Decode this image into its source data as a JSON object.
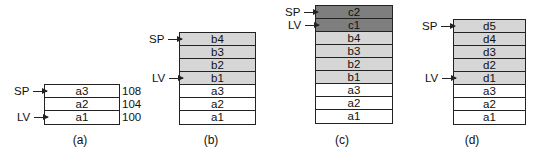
{
  "figure": {
    "panels": [
      {
        "caption": "(a)",
        "cells": [
          {
            "label": "a3",
            "shade": "white",
            "addr": "108"
          },
          {
            "label": "a2",
            "shade": "white",
            "addr": "104"
          },
          {
            "label": "a1",
            "shade": "white",
            "addr": "100"
          }
        ],
        "pointers": {
          "sp": "SP",
          "lv": "LV"
        }
      },
      {
        "caption": "(b)",
        "cells": [
          {
            "label": "b4",
            "shade": "light"
          },
          {
            "label": "b3",
            "shade": "light"
          },
          {
            "label": "b2",
            "shade": "light"
          },
          {
            "label": "b1",
            "shade": "light"
          },
          {
            "label": "a3",
            "shade": "white"
          },
          {
            "label": "a2",
            "shade": "white"
          },
          {
            "label": "a1",
            "shade": "white"
          }
        ],
        "pointers": {
          "sp": "SP",
          "lv": "LV"
        }
      },
      {
        "caption": "(c)",
        "cells": [
          {
            "label": "c2",
            "shade": "dark"
          },
          {
            "label": "c1",
            "shade": "dark"
          },
          {
            "label": "b4",
            "shade": "light"
          },
          {
            "label": "b3",
            "shade": "light"
          },
          {
            "label": "b2",
            "shade": "light"
          },
          {
            "label": "b1",
            "shade": "light"
          },
          {
            "label": "a3",
            "shade": "white"
          },
          {
            "label": "a2",
            "shade": "white"
          },
          {
            "label": "a1",
            "shade": "white"
          }
        ],
        "pointers": {
          "sp": "SP",
          "lv": "LV"
        }
      },
      {
        "caption": "(d)",
        "cells": [
          {
            "label": "d5",
            "shade": "light"
          },
          {
            "label": "d4",
            "shade": "light"
          },
          {
            "label": "d3",
            "shade": "light"
          },
          {
            "label": "d2",
            "shade": "light"
          },
          {
            "label": "d1",
            "shade": "light"
          },
          {
            "label": "a3",
            "shade": "white"
          },
          {
            "label": "a2",
            "shade": "white"
          },
          {
            "label": "a1",
            "shade": "white"
          }
        ],
        "pointers": {
          "sp": "SP",
          "lv": "LV"
        }
      }
    ],
    "colors": {
      "light": "#d6d6d6",
      "dark": "#7e7e7e",
      "white": "#ffffff",
      "line": "#222222"
    }
  }
}
